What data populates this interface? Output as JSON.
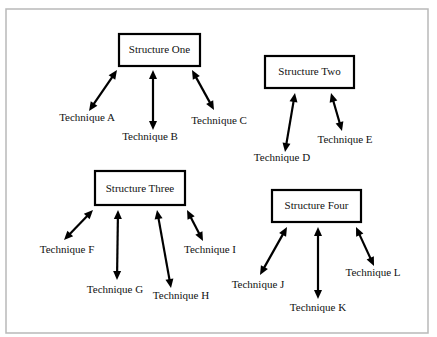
{
  "diagram": {
    "structures": [
      {
        "label": "Structure One",
        "techniques": [
          "Technique A",
          "Technique B",
          "Technique C"
        ]
      },
      {
        "label": "Structure Two",
        "techniques": [
          "Technique D",
          "Technique E"
        ]
      },
      {
        "label": "Structure Three",
        "techniques": [
          "Technique F",
          "Technique G",
          "Technique H",
          "Technique I"
        ]
      },
      {
        "label": "Structure Four",
        "techniques": [
          "Technique J",
          "Technique K",
          "Technique L"
        ]
      }
    ],
    "connector_style": "double-headed-arrow",
    "colors": {
      "box_stroke": "#000000",
      "arrow": "#000000",
      "frame": "#b9b9b9",
      "background": "#ffffff"
    }
  }
}
